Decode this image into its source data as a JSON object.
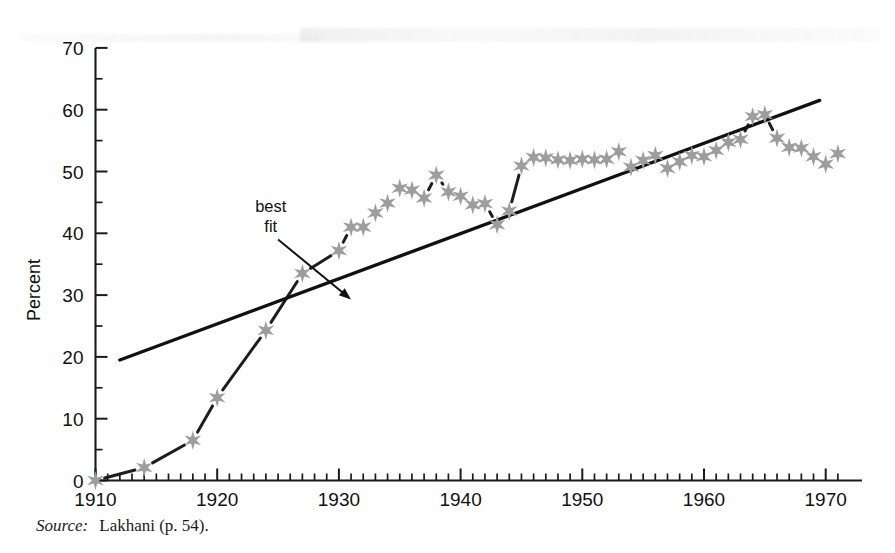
{
  "figure": {
    "source_label": "Source:",
    "source_value": "Lakhani (p. 54).",
    "marker_color": "#9d9d9d",
    "line_color": "#1d1d1d",
    "fit_color": "#111111"
  },
  "chart_data": {
    "type": "line",
    "title": "",
    "subtitle": "",
    "xlabel": "",
    "ylabel": "Percent",
    "xlim": [
      1910,
      1971
    ],
    "ylim": [
      0,
      70
    ],
    "grid": false,
    "legend": "none",
    "x_ticks_major": [
      1910,
      1920,
      1930,
      1940,
      1950,
      1960,
      1970
    ],
    "x_tick_labels": [
      "1910",
      "1920",
      "1930",
      "1940",
      "1950",
      "1960",
      "1970"
    ],
    "x_minor_step": 1,
    "y_ticks_major": [
      0,
      10,
      20,
      30,
      40,
      50,
      60,
      70
    ],
    "y_tick_labels": [
      "0",
      "10",
      "20",
      "30",
      "40",
      "50",
      "60",
      "70"
    ],
    "y_minor_step": 5,
    "annotations": [
      {
        "text_line1": "best",
        "text_line2": "fit",
        "text_x": 1924.4,
        "text_y": 43.5,
        "arrow_from": [
          1925.0,
          39.0
        ],
        "arrow_to": [
          1931.0,
          29.3
        ]
      }
    ],
    "series": [
      {
        "name": "observed",
        "style": "dashed-with-star-markers",
        "marker": "six-point-star",
        "color": "#9d9d9d",
        "points": [
          [
            1910,
            0.0
          ],
          [
            1914,
            2.1
          ],
          [
            1918,
            6.5
          ],
          [
            1920,
            13.4
          ],
          [
            1924,
            24.3
          ],
          [
            1927,
            33.5
          ],
          [
            1930,
            37.2
          ],
          [
            1931,
            41.0
          ],
          [
            1932,
            41.0
          ],
          [
            1933,
            43.3
          ],
          [
            1934,
            44.9
          ],
          [
            1935,
            47.3
          ],
          [
            1936,
            47.0
          ],
          [
            1937,
            45.7
          ],
          [
            1938,
            49.4
          ],
          [
            1939,
            46.7
          ],
          [
            1940,
            46.0
          ],
          [
            1941,
            44.6
          ],
          [
            1942,
            44.8
          ],
          [
            1943,
            41.4
          ],
          [
            1944,
            43.6
          ],
          [
            1945,
            50.9
          ],
          [
            1946,
            52.3
          ],
          [
            1947,
            52.2
          ],
          [
            1948,
            51.9
          ],
          [
            1949,
            51.8
          ],
          [
            1950,
            52.0
          ],
          [
            1951,
            51.9
          ],
          [
            1952,
            52.0
          ],
          [
            1953,
            53.2
          ],
          [
            1954,
            50.7
          ],
          [
            1955,
            51.8
          ],
          [
            1956,
            52.6
          ],
          [
            1957,
            50.5
          ],
          [
            1958,
            51.6
          ],
          [
            1959,
            52.6
          ],
          [
            1960,
            52.4
          ],
          [
            1961,
            53.4
          ],
          [
            1962,
            54.7
          ],
          [
            1963,
            55.2
          ],
          [
            1964,
            58.9
          ],
          [
            1965,
            59.2
          ],
          [
            1966,
            55.4
          ],
          [
            1967,
            53.9
          ],
          [
            1968,
            53.8
          ],
          [
            1969,
            52.4
          ],
          [
            1970,
            51.2
          ],
          [
            1971,
            52.9
          ]
        ]
      },
      {
        "name": "best fit",
        "style": "solid",
        "color": "#111111",
        "points": [
          [
            1912,
            19.5
          ],
          [
            1969.5,
            61.5
          ]
        ]
      }
    ]
  }
}
